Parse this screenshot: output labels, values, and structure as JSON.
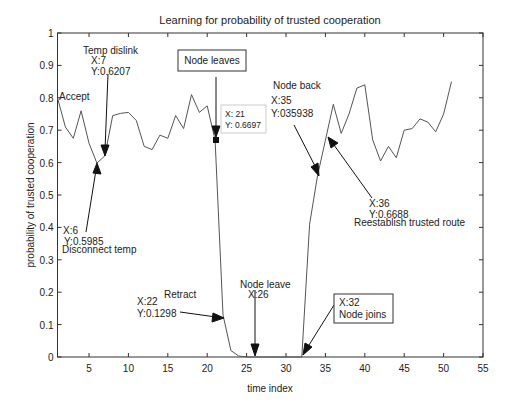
{
  "chart_data": {
    "type": "line",
    "title": "Learning for probability of trusted cooperation",
    "xlabel": "time index",
    "ylabel": "probability of trusted cooperation",
    "xlim": [
      1,
      55
    ],
    "ylim": [
      0,
      1
    ],
    "grid": false,
    "legend": null,
    "xticks": [
      5,
      10,
      15,
      20,
      25,
      30,
      35,
      40,
      45,
      50,
      55
    ],
    "yticks": [
      0,
      0.1,
      0.2,
      0.3,
      0.4,
      0.5,
      0.6,
      0.7,
      0.8,
      0.9,
      1
    ],
    "series": [
      {
        "name": "probability of trusted cooperation",
        "x": [
          1,
          2,
          3,
          4,
          5,
          6,
          7,
          8,
          9,
          10,
          11,
          12,
          13,
          14,
          15,
          16,
          17,
          18,
          19,
          20,
          21,
          22,
          23,
          24,
          25,
          26,
          27,
          28,
          29,
          30,
          31,
          32,
          33,
          34,
          35,
          36,
          37,
          38,
          39,
          40,
          41,
          42,
          43,
          44,
          45,
          46,
          47,
          48,
          49,
          50,
          51
        ],
        "values": [
          0.8,
          0.71,
          0.675,
          0.76,
          0.66,
          0.5985,
          0.6207,
          0.745,
          0.752,
          0.755,
          0.73,
          0.65,
          0.64,
          0.685,
          0.675,
          0.745,
          0.705,
          0.81,
          0.755,
          0.775,
          0.6697,
          0.1298,
          0.02,
          0.003,
          0,
          0,
          0,
          0,
          0,
          0,
          0,
          0,
          0.41,
          0.5594,
          0.6688,
          0.78,
          0.69,
          0.75,
          0.83,
          0.84,
          0.67,
          0.605,
          0.65,
          0.615,
          0.7,
          0.705,
          0.735,
          0.725,
          0.695,
          0.75,
          0.85
        ]
      }
    ],
    "annotations": [
      {
        "text": "Accept",
        "x": 1,
        "y": 0.8
      },
      {
        "text": "Temp dislink",
        "lines": [
          "Temp dislink",
          "X:7",
          "Y:0.6207"
        ],
        "x": 7,
        "y": 0.6207
      },
      {
        "text": "Disconnect temp",
        "lines": [
          "X:6",
          "Y:0.5985",
          "Disconnect temp"
        ],
        "x": 6,
        "y": 0.5985
      },
      {
        "text": "Node leaves",
        "boxed": true,
        "x": 21,
        "y": 0.6697
      },
      {
        "text": "datatip",
        "lines": [
          "X: 21",
          "Y: 0.6697"
        ],
        "x": 21,
        "y": 0.6697
      },
      {
        "text": "Retract",
        "lines": [
          "Retract",
          "X:22",
          "Y:0.1298"
        ],
        "x": 22,
        "y": 0.1298
      },
      {
        "text": "Node leave",
        "lines": [
          "Node leave",
          "X:26"
        ],
        "x": 26,
        "y": 0
      },
      {
        "text": "Node joins",
        "boxed": true,
        "lines": [
          "X:32",
          "Node joins"
        ],
        "x": 32,
        "y": 0
      },
      {
        "text": "Node back",
        "lines": [
          "Node back",
          "X:35",
          "Y:035938"
        ],
        "x": 34,
        "y": 0.5594
      },
      {
        "text": "Reestablish trusted route",
        "lines": [
          "X:36",
          "Y:0.6688",
          "Reestablish trusted route"
        ],
        "x": 35,
        "y": 0.6688
      }
    ]
  },
  "labels": {
    "title": "Learning for probability of trusted cooperation",
    "xlabel": "time index",
    "ylabel": "probability of trusted cooperation",
    "accept": "Accept",
    "temp_dislink": [
      "Temp dislink",
      "X:7",
      "Y:0.6207"
    ],
    "disconnect_temp": [
      "X:6",
      "Y:0.5985",
      "Disconnect temp"
    ],
    "node_leaves": "Node leaves",
    "datatip": [
      "X: 21",
      "Y: 0.6697"
    ],
    "retract": [
      "Retract",
      "X:22",
      "Y:0.1298"
    ],
    "node_leave": [
      "Node leave",
      "X:26"
    ],
    "node_joins": [
      "X:32",
      "Node joins"
    ],
    "node_back": [
      "Node back",
      "X:35",
      "Y:035938"
    ],
    "reestablish": [
      "X:36",
      "Y:0.6688",
      "Reestablish trusted route"
    ]
  },
  "style": {
    "line_color": "#555555",
    "axis_color": "#333333",
    "text_color": "#222222"
  }
}
